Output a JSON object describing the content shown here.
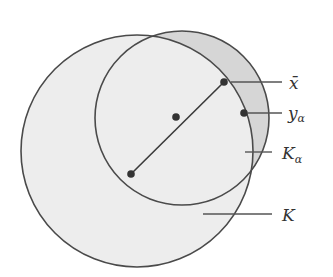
{
  "diagram": {
    "type": "set-geometry",
    "colors": {
      "stroke": "#4a4a4a",
      "fill_K": "#eeeeee",
      "fill_crescent": "#d9d9d9",
      "label": "#333333",
      "background": "#ffffff"
    },
    "circles": [
      {
        "name": "K",
        "cx": 137,
        "cy": 151,
        "r": 116
      },
      {
        "name": "K_alpha",
        "cx": 182,
        "cy": 118,
        "r": 87
      }
    ],
    "points": [
      {
        "name": "center",
        "x": 131,
        "y": 174
      },
      {
        "name": "midpoint",
        "x": 176,
        "y": 117
      },
      {
        "name": "x_bar",
        "x": 224,
        "y": 82
      },
      {
        "name": "y_alpha",
        "x": 244,
        "y": 113
      }
    ],
    "labels": {
      "x_bar": "x̄",
      "y_alpha_base": "y",
      "y_alpha_sub": "α",
      "K_alpha_base": "K",
      "K_alpha_sub": "α",
      "K": "K"
    }
  }
}
